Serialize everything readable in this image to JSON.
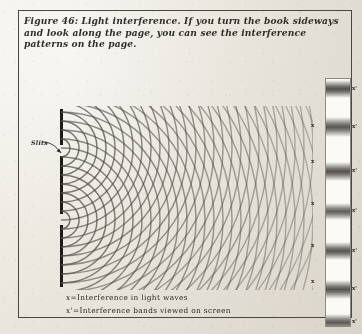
{
  "figure": {
    "caption": "Figure 46: Light interference. If you turn the book sideways and look along the page, you can see the interference patterns on the page.",
    "slits_label": "Slits",
    "legend": [
      "x=Interference in light waves",
      "x'=Interference bands viewed on screen"
    ],
    "wave_marker": "x",
    "screen_marker": "x'"
  },
  "colors": {
    "ink": "#1d1b18",
    "paper": "#f2f0ec",
    "frame": "#4a4741",
    "wave": "#4b4844",
    "fringe": "#3a3733"
  },
  "chart_data": {
    "type": "diagram",
    "source_count": 2,
    "sources": [
      {
        "id": "slit-upper",
        "x": 0,
        "y": 42
      },
      {
        "id": "slit-lower",
        "x": 0,
        "y": 114
      }
    ],
    "wavelength_px": 9.0,
    "wave_rings_per_source": 30,
    "antinode_markers_x": [
      {
        "label": "x",
        "left": 293,
        "top": 112
      },
      {
        "label": "x",
        "left": 293,
        "top": 148
      },
      {
        "label": "x",
        "left": 293,
        "top": 190
      },
      {
        "label": "x",
        "left": 293,
        "top": 232
      },
      {
        "label": "x",
        "left": 293,
        "top": 268
      }
    ],
    "screen_fringes": [
      {
        "label": "x'",
        "center_y": 10,
        "thickness": 18,
        "intensity": 0.82
      },
      {
        "label": "x'",
        "center_y": 48,
        "thickness": 20,
        "intensity": 0.78
      },
      {
        "label": "x'",
        "center_y": 92,
        "thickness": 19,
        "intensity": 0.8
      },
      {
        "label": "x'",
        "center_y": 132,
        "thickness": 17,
        "intensity": 0.74
      },
      {
        "label": "x'",
        "center_y": 172,
        "thickness": 18,
        "intensity": 0.79
      },
      {
        "label": "x'",
        "center_y": 210,
        "thickness": 19,
        "intensity": 0.8
      },
      {
        "label": "x'",
        "center_y": 243,
        "thickness": 17,
        "intensity": 0.76
      }
    ],
    "axis_note": "no numeric axes; schematic physics textbook figure"
  }
}
